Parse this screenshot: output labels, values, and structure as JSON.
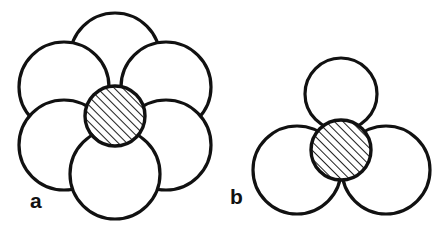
{
  "figure": {
    "background_color": "#ffffff",
    "stroke_color": "#111111",
    "fill_color": "#ffffff",
    "hatch_color": "#111111",
    "stroke_width": 3.2,
    "hatch_stroke_width": 1.9,
    "hatch_spacing": 6,
    "hatch_angle_deg": 45,
    "width": 445,
    "height": 226
  },
  "panels": [
    {
      "id": "a",
      "label": "a",
      "label_x": 30,
      "label_y": 208,
      "description": "octahedral-site-packing",
      "host_circle_radius": 45,
      "center_circle": {
        "name": "interstitial-sphere-a",
        "cx": 115,
        "cy": 116,
        "r": 30,
        "hatched": true
      },
      "host_circles": [
        {
          "name": "host-sphere-a-top",
          "cx": 115,
          "cy": 58,
          "r": 45
        },
        {
          "name": "host-sphere-a-upper-left",
          "cx": 64,
          "cy": 87,
          "r": 45
        },
        {
          "name": "host-sphere-a-upper-right",
          "cx": 166,
          "cy": 87,
          "r": 45
        },
        {
          "name": "host-sphere-a-lower-left",
          "cx": 64,
          "cy": 145,
          "r": 45
        },
        {
          "name": "host-sphere-a-lower-right",
          "cx": 166,
          "cy": 145,
          "r": 45
        },
        {
          "name": "host-sphere-a-bottom",
          "cx": 115,
          "cy": 174,
          "r": 45
        }
      ]
    },
    {
      "id": "b",
      "label": "b",
      "label_x": 230,
      "label_y": 204,
      "description": "tetrahedral-site-packing",
      "host_circle_radius": 43,
      "center_circle": {
        "name": "interstitial-sphere-b",
        "cx": 341,
        "cy": 150,
        "r": 30,
        "hatched": true
      },
      "host_circles": [
        {
          "name": "host-sphere-b-top",
          "cx": 341,
          "cy": 94,
          "r": 36
        },
        {
          "name": "host-sphere-b-left",
          "cx": 297,
          "cy": 170,
          "r": 44
        },
        {
          "name": "host-sphere-b-right",
          "cx": 386,
          "cy": 170,
          "r": 44
        }
      ]
    }
  ]
}
